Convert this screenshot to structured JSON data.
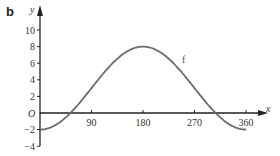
{
  "panel_label": "b",
  "chart_data": {
    "type": "line",
    "title": "",
    "xlabel": "x",
    "ylabel": "y",
    "origin_label": "O",
    "xlim": [
      0,
      370
    ],
    "ylim": [
      -4,
      11
    ],
    "x_ticks": [
      90,
      180,
      270,
      360
    ],
    "y_ticks": [
      10,
      8,
      6,
      4,
      2,
      -2,
      -4
    ],
    "grid": false,
    "legend": "none",
    "annotations": [
      {
        "text": "f",
        "x": 248,
        "y": 6
      }
    ],
    "series": [
      {
        "name": "f",
        "color": "#6b6b6b",
        "function": "y = 3 - 5cos(x)",
        "x": [
          0,
          30,
          53,
          60,
          90,
          120,
          150,
          180,
          210,
          240,
          270,
          300,
          307,
          330,
          360
        ],
        "y": [
          -2,
          -1.33,
          0,
          0.5,
          3,
          5.5,
          7.33,
          8,
          7.33,
          5.5,
          3,
          0.5,
          0,
          -1.33,
          -2
        ]
      }
    ]
  }
}
